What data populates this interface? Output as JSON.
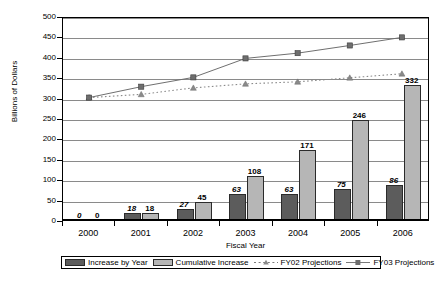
{
  "chart_data": {
    "type": "bar",
    "title": "",
    "xlabel": "Fiscal Year",
    "ylabel": "Billions of Dollars",
    "ylim": [
      0,
      500
    ],
    "ytick_step": 50,
    "yticks": [
      0,
      50,
      100,
      150,
      200,
      250,
      300,
      350,
      400,
      450,
      500
    ],
    "categories": [
      "2000",
      "2001",
      "2002",
      "2003",
      "2004",
      "2005",
      "2006"
    ],
    "grid": true,
    "legend_position": "bottom",
    "series": [
      {
        "name": "Increase by Year",
        "type": "bar",
        "color": "#5c5c5c",
        "values": [
          0,
          18,
          27,
          63,
          63,
          75,
          86
        ],
        "labels": [
          "0",
          "18",
          "27",
          "63",
          "63",
          "75",
          "86"
        ],
        "label_style": "italic"
      },
      {
        "name": "Cumulative Increase",
        "type": "bar",
        "color": "#b6b6b6",
        "values": [
          0,
          18,
          45,
          108,
          171,
          246,
          332
        ],
        "labels": [
          "0",
          "18",
          "45",
          "108",
          "171",
          "246",
          "332"
        ],
        "label_style": "plain"
      },
      {
        "name": "FY02 Projections",
        "type": "line",
        "color": "#8a8a8a",
        "marker": "triangle",
        "line_style": "dotted",
        "values": [
          303,
          311,
          327,
          337,
          342,
          352,
          362
        ]
      },
      {
        "name": "FY03 Projections",
        "type": "line",
        "color": "#6e6e6e",
        "marker": "square",
        "line_style": "solid",
        "values": [
          303,
          330,
          353,
          400,
          413,
          432,
          452
        ]
      }
    ]
  },
  "legend": {
    "items": [
      {
        "label": "Increase by Year",
        "key": "swatch-dark"
      },
      {
        "label": "Cumulative Increase",
        "key": "swatch-light"
      },
      {
        "label": "FY02 Projections",
        "key": "line-dotted-triangle"
      },
      {
        "label": "FY03 Projections",
        "key": "line-solid-square"
      }
    ]
  }
}
